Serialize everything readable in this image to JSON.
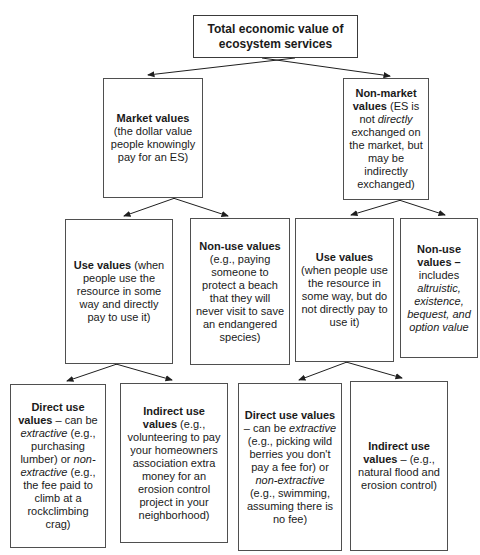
{
  "colors": {
    "background": "#ffffff",
    "box_border": "#4f4f4f",
    "connector_line": "#1f1f1f",
    "text": "#1a1a1a"
  },
  "diagram": {
    "title": "Total economic value of ecosystem services",
    "nodes": {
      "total": {
        "segments": [
          {
            "text": "Total economic value of ecosystem services",
            "style": "bold"
          }
        ]
      },
      "market": {
        "segments": [
          {
            "text": "Market values",
            "style": "bold"
          },
          {
            "text": " (the dollar value people knowingly pay for an ES)",
            "style": "normal"
          }
        ]
      },
      "nonmarket": {
        "segments": [
          {
            "text": "Non-market values",
            "style": "bold"
          },
          {
            "text": " (ES is not ",
            "style": "normal"
          },
          {
            "text": "directly",
            "style": "italic"
          },
          {
            "text": " exchanged on the market, but may be indirectly exchanged)",
            "style": "normal"
          }
        ]
      },
      "use_left": {
        "segments": [
          {
            "text": "Use values",
            "style": "bold"
          },
          {
            "text": " (when people use the resource in some way and directly pay to use it)",
            "style": "normal"
          }
        ]
      },
      "nonuse_left": {
        "segments": [
          {
            "text": "Non-use values",
            "style": "bold"
          },
          {
            "text": " (e.g., paying someone to protect a beach that they will never visit to save an endangered species)",
            "style": "normal"
          }
        ]
      },
      "use_right": {
        "segments": [
          {
            "text": "Use values",
            "style": "bold"
          },
          {
            "text": " (when people use the resource in some way, but do not directly pay to use it)",
            "style": "normal"
          }
        ]
      },
      "nonuse_right": {
        "segments": [
          {
            "text": "Non-use values –",
            "style": "bold"
          },
          {
            "text": " includes ",
            "style": "normal"
          },
          {
            "text": "altruistic, existence, bequest, and option value",
            "style": "italic"
          }
        ]
      },
      "direct_left": {
        "segments": [
          {
            "text": "Direct use values",
            "style": "bold"
          },
          {
            "text": " – can be ",
            "style": "normal"
          },
          {
            "text": "extractive",
            "style": "italic"
          },
          {
            "text": " (e.g., purchasing lumber) or ",
            "style": "normal"
          },
          {
            "text": "non-extractive",
            "style": "italic"
          },
          {
            "text": " (e.g., the fee paid to climb at a rockclimbing crag)",
            "style": "normal"
          }
        ]
      },
      "indirect_left": {
        "segments": [
          {
            "text": "Indirect use values",
            "style": "bold"
          },
          {
            "text": " (e.g., volunteering to pay your homeowners association extra money for an erosion control project in your neighborhood)",
            "style": "normal"
          }
        ]
      },
      "direct_right": {
        "segments": [
          {
            "text": "Direct use values",
            "style": "bold"
          },
          {
            "text": " – can be ",
            "style": "normal"
          },
          {
            "text": "extractive",
            "style": "italic"
          },
          {
            "text": " (e.g., picking wild berries you don't pay a fee for) or ",
            "style": "normal"
          },
          {
            "text": "non-extractive",
            "style": "italic"
          },
          {
            "text": " (e.g., swimming, assuming there is no fee)",
            "style": "normal"
          }
        ]
      },
      "indirect_right": {
        "segments": [
          {
            "text": "Indirect use values",
            "style": "bold"
          },
          {
            "text": " – (e.g., natural flood and erosion control)",
            "style": "normal"
          }
        ]
      }
    },
    "edges": [
      {
        "from": "total",
        "to": "market"
      },
      {
        "from": "total",
        "to": "nonmarket"
      },
      {
        "from": "market",
        "to": "use_left"
      },
      {
        "from": "market",
        "to": "nonuse_left"
      },
      {
        "from": "nonmarket",
        "to": "use_right"
      },
      {
        "from": "nonmarket",
        "to": "nonuse_right"
      },
      {
        "from": "use_left",
        "to": "direct_left"
      },
      {
        "from": "use_left",
        "to": "indirect_left"
      },
      {
        "from": "use_right",
        "to": "direct_right"
      },
      {
        "from": "use_right",
        "to": "indirect_right"
      }
    ]
  }
}
